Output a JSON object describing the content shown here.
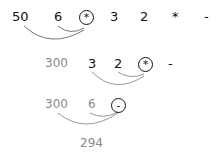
{
  "colors": {
    "primary": "#111111",
    "secondary": "#8a8a8a"
  },
  "rows": [
    {
      "tokens": [
        "50",
        "6",
        "*",
        "3",
        "2",
        "*",
        "-"
      ],
      "highlighted_operator_index": 2,
      "operands_linked": [
        "50",
        "6"
      ]
    },
    {
      "tokens": [
        "300",
        "3",
        "2",
        "*",
        "-"
      ],
      "highlighted_operator_index": 3,
      "operands_linked": [
        "3",
        "2"
      ]
    },
    {
      "tokens": [
        "300",
        "6",
        "-"
      ],
      "highlighted_operator_index": 2,
      "operands_linked": [
        "300",
        "6"
      ]
    }
  ],
  "result": "294"
}
